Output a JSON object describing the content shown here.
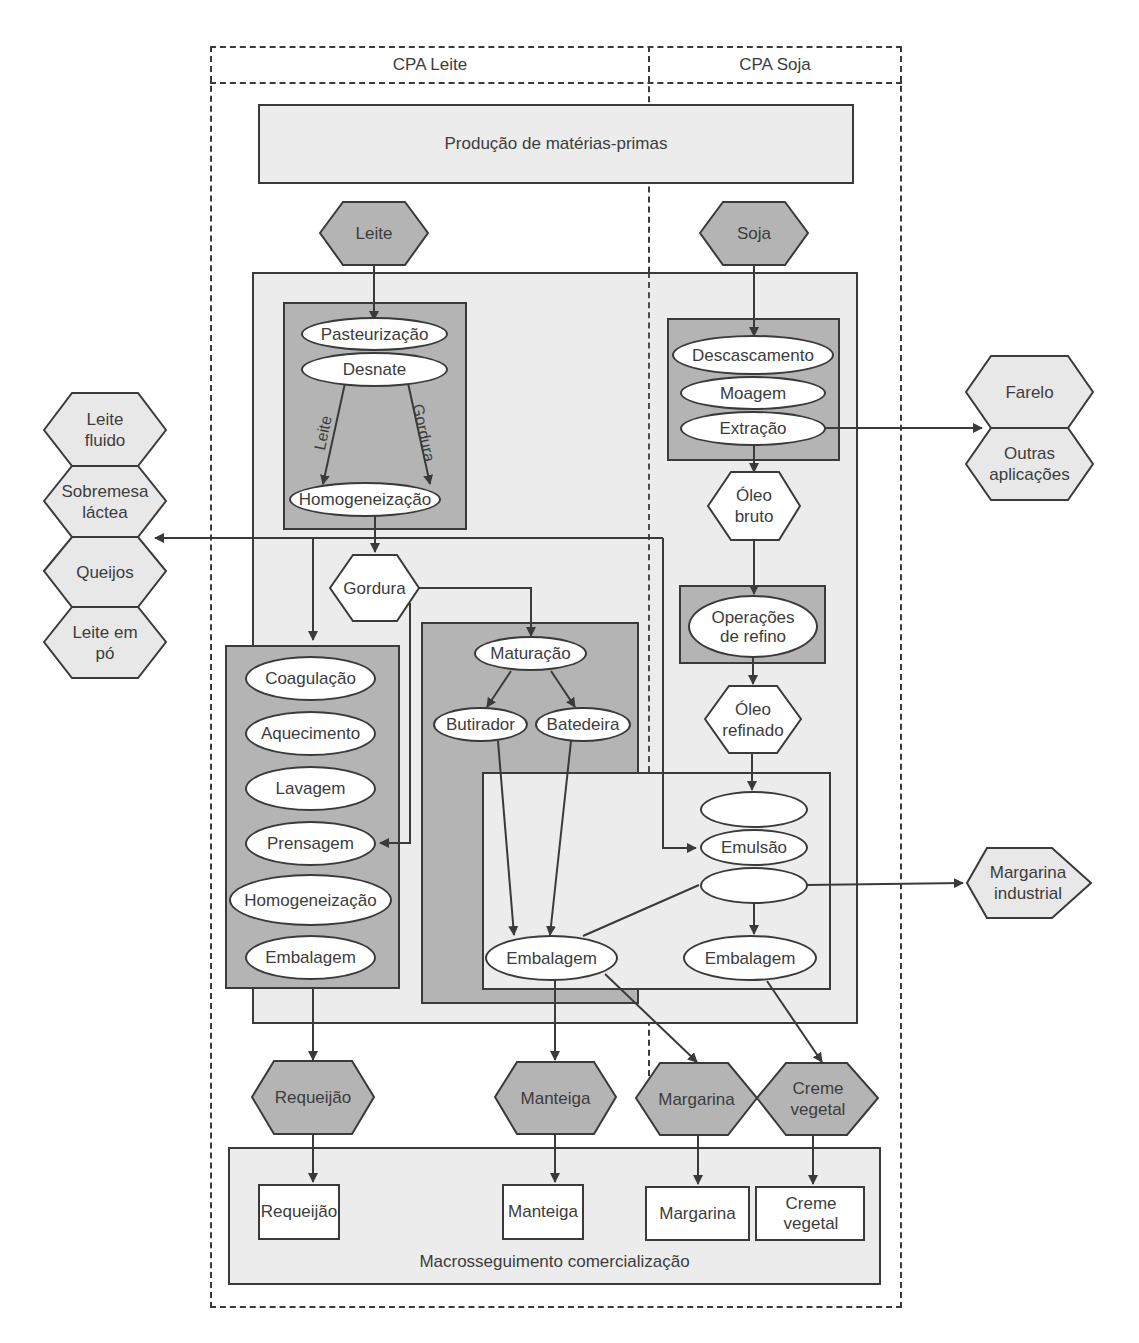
{
  "header": {
    "left_column": "CPA Leite",
    "right_column": "CPA Soja"
  },
  "top_box": "Produção de matérias-primas",
  "bottom_box": "Macrosseguimento comercialização",
  "raw_materials": {
    "milk": "Leite",
    "soy": "Soja"
  },
  "milk_processing": {
    "steps": [
      "Pasteurização",
      "Desnate",
      "Homogeneização"
    ],
    "branch_left_label": "Leite",
    "branch_right_label": "Gordura"
  },
  "fat_node": "Gordura",
  "milk_side_products": [
    "Leite fluido",
    "Sobremesa láctea",
    "Queijos",
    "Leite em pó"
  ],
  "cheese_process": {
    "steps": [
      "Coagulação",
      "Aquecimento",
      "Lavagem",
      "Prensagem",
      "Homogeneização",
      "Embalagem"
    ]
  },
  "butter_process": {
    "steps": [
      "Maturação",
      "Butirador",
      "Batedeira"
    ]
  },
  "soy_processing": {
    "steps": [
      "Descascamento",
      "Moagem",
      "Extração"
    ]
  },
  "soy_side_products": [
    "Farelo",
    "Outras aplicações"
  ],
  "crude_oil": "Óleo bruto",
  "refining": "Operações de refino",
  "refined_oil": "Óleo refinado",
  "emulsion_process": {
    "steps": [
      "",
      "Emulsão",
      ""
    ],
    "packaging_left": "Embalagem",
    "packaging_right": "Embalagem"
  },
  "industrial_output": "Margarina industrial",
  "final_products": [
    "Requeijão",
    "Manteiga",
    "Margarina",
    "Creme vegetal"
  ],
  "retail_products": [
    "Requeijão",
    "Manteiga",
    "Margarina",
    "Creme vegetal"
  ],
  "colors": {
    "stroke": "#3a3a3a",
    "light_fill": "#ececec",
    "mid_fill": "#b4b4b4",
    "hex_dark_fill": "#b4b4b4",
    "hex_light_fill": "#e8e8e8",
    "white": "#ffffff"
  }
}
